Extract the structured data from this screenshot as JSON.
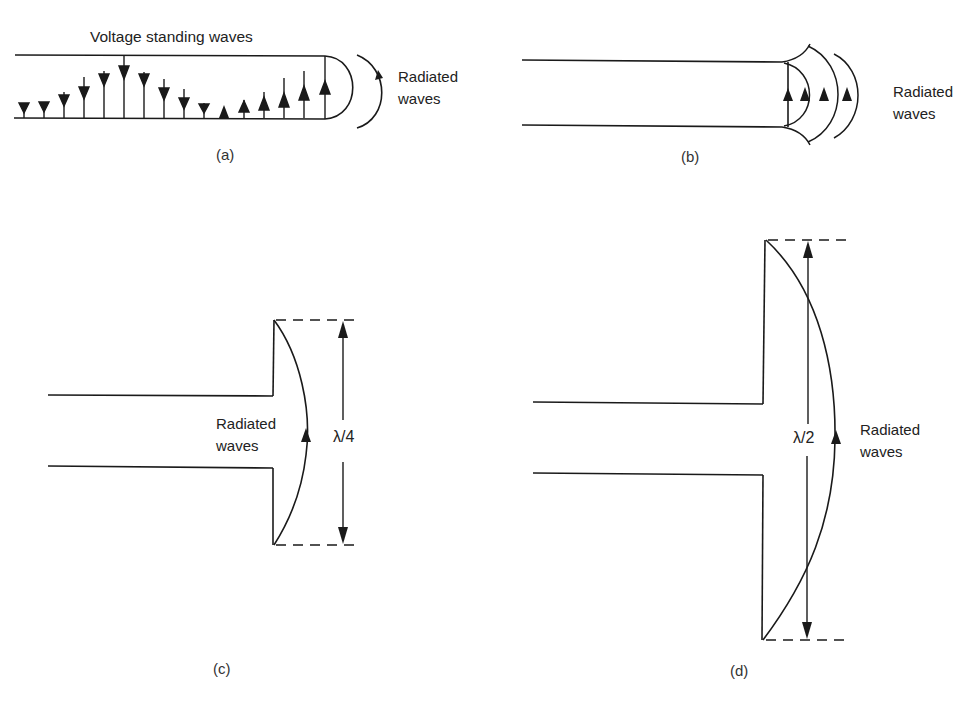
{
  "figure": {
    "panels": [
      {
        "id": "a",
        "caption": "(a)",
        "title": "Voltage standing waves",
        "radiated_label": [
          "Radiated",
          "waves"
        ],
        "description": "Open-ended two-wire line with voltage standing wave arrows, rounded end, radiated wave arc"
      },
      {
        "id": "b",
        "caption": "(b)",
        "radiated_label": [
          "Radiated",
          "waves"
        ],
        "description": "Two-wire line with flared end and concentric radiated wavefronts"
      },
      {
        "id": "c",
        "caption": "(c)",
        "radiated_label": [
          "Radiated",
          "waves"
        ],
        "dimension_label": "λ/4",
        "description": "Line terminated in quarter-wave dipole element"
      },
      {
        "id": "d",
        "caption": "(d)",
        "radiated_label": [
          "Radiated",
          "waves"
        ],
        "dimension_label": "λ/2",
        "description": "Line terminated in half-wave dipole element"
      }
    ],
    "colors": {
      "line": "#1a1a1a",
      "background": "#ffffff"
    }
  }
}
